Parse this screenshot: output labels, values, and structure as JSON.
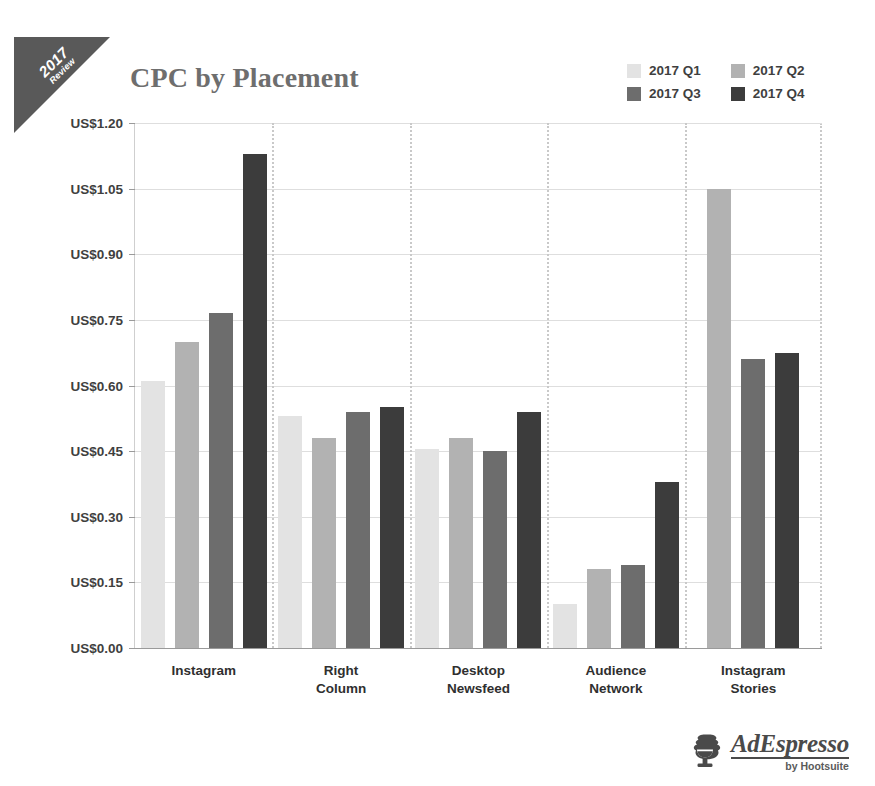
{
  "ribbon": {
    "year": "2017",
    "subtitle": "Review"
  },
  "title": "CPC by Placement",
  "legend": {
    "position": "top-right",
    "items": [
      {
        "label": "2017 Q1",
        "color": "#e3e3e3"
      },
      {
        "label": "2017 Q2",
        "color": "#b2b2b2"
      },
      {
        "label": "2017 Q3",
        "color": "#6d6d6d"
      },
      {
        "label": "2017 Q4",
        "color": "#3c3c3c"
      }
    ]
  },
  "brand": {
    "name": "AdEspresso",
    "tagline": "by Hootsuite",
    "mark": "espresso-cup-icon"
  },
  "axis": {
    "y_tick_labels": [
      "US$1.20",
      "US$1.05",
      "US$0.90",
      "US$0.75",
      "US$0.60",
      "US$0.45",
      "US$0.30",
      "US$0.15",
      "US$0.00"
    ],
    "x_tick_labels": [
      "Instagram",
      "Right\nColumn",
      "Desktop\nNewsfeed",
      "Audience\nNetwork",
      "Instagram\nStories"
    ]
  },
  "chart_data": {
    "type": "bar",
    "title": "CPC by Placement",
    "xlabel": "",
    "ylabel": "",
    "ylim": [
      0,
      1.2
    ],
    "ytick_interval": 0.15,
    "ytick_prefix": "US$",
    "grid": true,
    "legend_position": "top-right",
    "categories": [
      "Instagram",
      "Right Column",
      "Desktop Newsfeed",
      "Audience Network",
      "Instagram Stories"
    ],
    "series": [
      {
        "name": "2017 Q1",
        "color": "#e3e3e3",
        "values": [
          0.61,
          0.53,
          0.455,
          0.1,
          null
        ]
      },
      {
        "name": "2017 Q2",
        "color": "#b2b2b2",
        "values": [
          0.7,
          0.48,
          0.48,
          0.18,
          1.05
        ]
      },
      {
        "name": "2017 Q3",
        "color": "#6d6d6d",
        "values": [
          0.765,
          0.54,
          0.45,
          0.19,
          0.66
        ]
      },
      {
        "name": "2017 Q4",
        "color": "#3c3c3c",
        "values": [
          1.13,
          0.55,
          0.54,
          0.38,
          0.675
        ]
      }
    ]
  }
}
